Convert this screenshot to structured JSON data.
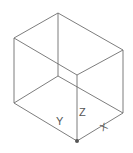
{
  "diagram": {
    "type": "isometric wireframe box",
    "line_color": "#6e6e6e",
    "axis_labels": {
      "x": "X",
      "y": "Y",
      "z": "Z"
    },
    "vertices": {
      "top_back": [
        58,
        13
      ],
      "top_left": [
        14,
        38
      ],
      "top_right": [
        123,
        50
      ],
      "top_front": [
        77,
        75
      ],
      "bottom_back": [
        58,
        76
      ],
      "bottom_left": [
        14,
        103
      ],
      "bottom_right": [
        123,
        113
      ],
      "bottom_front": [
        77,
        141
      ]
    }
  }
}
